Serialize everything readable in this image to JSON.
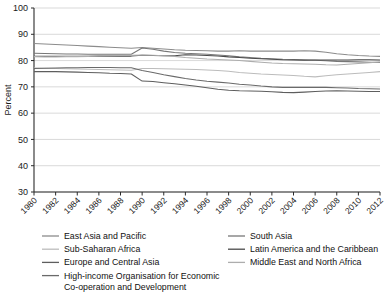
{
  "chart_data": {
    "type": "line",
    "title": "",
    "xlabel": "",
    "ylabel": "Percent",
    "ylim": [
      30,
      100
    ],
    "xlim": [
      1980,
      2012
    ],
    "yticks": [
      30,
      40,
      50,
      60,
      70,
      80,
      90,
      100
    ],
    "xticks": [
      1980,
      1982,
      1984,
      1986,
      1988,
      1990,
      1992,
      1994,
      1996,
      1998,
      2000,
      2002,
      2004,
      2006,
      2008,
      2010,
      2012
    ],
    "grid": "horizontal",
    "legend_position": "below",
    "x": [
      1980,
      1981,
      1982,
      1983,
      1984,
      1985,
      1986,
      1987,
      1988,
      1989,
      1990,
      1991,
      1992,
      1993,
      1994,
      1995,
      1996,
      1997,
      1998,
      1999,
      2000,
      2001,
      2002,
      2003,
      2004,
      2005,
      2006,
      2007,
      2008,
      2009,
      2010,
      2011,
      2012
    ],
    "series": [
      {
        "name": "East Asia and Pacific",
        "color": "#8c8c8c",
        "values": [
          86.5,
          86.3,
          86.1,
          85.9,
          85.7,
          85.5,
          85.3,
          85.1,
          84.9,
          84.7,
          85.0,
          84.7,
          84.4,
          84.1,
          83.9,
          83.8,
          83.7,
          83.6,
          83.6,
          83.7,
          83.6,
          83.6,
          83.6,
          83.6,
          83.6,
          83.7,
          83.6,
          83.2,
          82.6,
          82.2,
          81.9,
          81.7,
          81.6
        ]
      },
      {
        "name": "South Asia",
        "color": "#777777",
        "values": [
          82.8,
          82.7,
          82.6,
          82.5,
          82.5,
          82.4,
          82.4,
          82.4,
          82.4,
          82.4,
          84.8,
          84.3,
          83.6,
          83.1,
          82.8,
          82.6,
          82.4,
          82.1,
          81.8,
          81.4,
          81.2,
          80.9,
          80.7,
          80.5,
          80.4,
          80.3,
          80.1,
          79.9,
          79.7,
          79.6,
          79.5,
          79.4,
          79.3
        ]
      },
      {
        "name": "Sub-Saharan Africa",
        "color": "#bcbcbc",
        "values": [
          77.2,
          77.1,
          77.0,
          76.9,
          76.8,
          76.7,
          76.6,
          76.5,
          76.4,
          76.3,
          77.0,
          77.0,
          76.9,
          76.8,
          76.7,
          76.6,
          76.4,
          76.2,
          75.9,
          75.5,
          75.2,
          74.9,
          74.7,
          74.5,
          74.3,
          74.0,
          73.8,
          74.2,
          74.6,
          74.9,
          75.2,
          75.5,
          75.8
        ]
      },
      {
        "name": "Latin America and the Caribbean",
        "color": "#4a4a4a",
        "values": [
          81.6,
          81.6,
          81.6,
          81.6,
          81.6,
          81.6,
          81.7,
          81.7,
          81.7,
          81.7,
          82.0,
          81.9,
          81.8,
          81.8,
          82.2,
          82.1,
          81.9,
          81.7,
          81.4,
          81.2,
          80.9,
          80.7,
          80.5,
          80.3,
          80.2,
          80.1,
          80.2,
          80.2,
          80.2,
          80.2,
          80.3,
          80.3,
          80.2
        ]
      },
      {
        "name": "Europe and Central Asia",
        "color": "#5e5e5e",
        "values": [
          75.8,
          75.8,
          75.8,
          75.7,
          75.6,
          75.5,
          75.4,
          75.2,
          75.1,
          74.9,
          72.2,
          72.0,
          71.6,
          71.2,
          70.7,
          70.2,
          69.7,
          69.1,
          68.7,
          68.5,
          68.4,
          68.3,
          68.1,
          67.9,
          67.8,
          68.0,
          68.2,
          68.4,
          68.5,
          68.4,
          68.3,
          68.2,
          68.2
        ]
      },
      {
        "name": "Middle East and North Africa",
        "color": "#adadad",
        "values": [
          81.5,
          81.4,
          81.4,
          81.5,
          81.5,
          81.6,
          81.7,
          81.8,
          81.9,
          82.0,
          82.1,
          82.0,
          81.8,
          81.6,
          81.2,
          80.9,
          80.6,
          80.4,
          80.2,
          80.0,
          79.7,
          79.4,
          79.1,
          78.9,
          78.8,
          78.7,
          78.6,
          78.4,
          78.3,
          78.6,
          78.9,
          79.2,
          79.5
        ]
      },
      {
        "name": "High-income Organisation for Economic Co-operation and Development",
        "color": "#6a6a6a",
        "values": [
          77.0,
          77.1,
          77.2,
          77.3,
          77.3,
          77.4,
          77.4,
          77.4,
          77.3,
          77.3,
          76.2,
          75.5,
          74.6,
          73.9,
          73.2,
          72.6,
          72.1,
          71.8,
          71.5,
          71.0,
          70.7,
          70.3,
          70.0,
          69.8,
          69.8,
          69.8,
          69.8,
          69.8,
          69.7,
          69.6,
          69.4,
          69.3,
          69.2
        ]
      }
    ],
    "legend": {
      "column_left": [
        "East Asia and Pacific",
        "Sub-Saharan Africa",
        "Europe and Central Asia",
        "High-income Organisation for Economic"
      ],
      "column_left_continuation": "Co-operation and Development",
      "column_right": [
        "South Asia",
        "Latin America and the Caribbean",
        "Middle East and North Africa"
      ]
    }
  }
}
